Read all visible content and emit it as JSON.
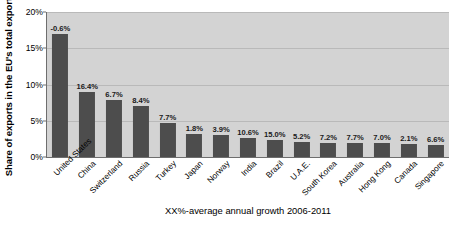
{
  "chart_data": {
    "type": "bar",
    "title": "",
    "xlabel": "XX%-average annual growth 2006-2011",
    "ylabel": "Share of exports in the EU's total exports",
    "ylim": [
      0,
      20
    ],
    "yticks": [
      "0%",
      "5%",
      "10%",
      "15%",
      "20%"
    ],
    "ytick_values": [
      0,
      5,
      10,
      15,
      20
    ],
    "grid": true,
    "legend": null,
    "categories": [
      "United States",
      "China",
      "Switzerland",
      "Russia",
      "Turkey",
      "Japan",
      "Norway",
      "India",
      "Brazil",
      "U.A.E.",
      "South Korea",
      "Australia",
      "Hong Kong",
      "Canada",
      "Singapore"
    ],
    "values": [
      17.0,
      8.9,
      7.9,
      7.0,
      4.7,
      3.2,
      3.1,
      2.6,
      2.3,
      2.1,
      2.0,
      1.9,
      1.9,
      1.8,
      1.6
    ],
    "data_labels": [
      "-0.6%",
      "16.4%",
      "6.7%",
      "8.4%",
      "7.7%",
      "1.8%",
      "3.9%",
      "10.6%",
      "15.0%",
      "5.2%",
      "7.2%",
      "7.7%",
      "7.0%",
      "2.1%",
      "6.6%"
    ],
    "annotation_meaning": "Data labels show average annual growth 2006-2011; bar heights show share of exports in the EU's total exports.",
    "colors": {
      "bar": "#4d4d4d",
      "plot_background": "#d3d3d3",
      "gridline": "#b9b9b9",
      "axis": "#6e6e6e",
      "text": "#000000",
      "page_background": "#ffffff"
    }
  }
}
